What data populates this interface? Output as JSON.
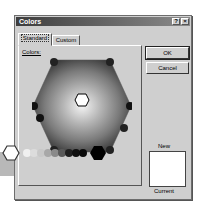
{
  "dialog": {
    "title": "Colors",
    "help_label": "?",
    "close_label": "×",
    "tabs": [
      {
        "label": "Standard",
        "active": true
      },
      {
        "label": "Custom",
        "active": false
      }
    ],
    "colors_label": "Colors:",
    "ok_label": "OK",
    "cancel_label": "Cancel",
    "new_label": "New",
    "current_label": "Current",
    "new_color": "#ffffff",
    "selected_color": "#ffffff"
  },
  "palette": {
    "grayscale": [
      "#ffffff",
      "#e6e6e6",
      "#d2d2d2",
      "#bdbdbd",
      "#a4a4a4",
      "#8a8a8a",
      "#6c6c6c",
      "#4a4a4a",
      "#2e2e2e",
      "#141414",
      "#000000"
    ]
  }
}
